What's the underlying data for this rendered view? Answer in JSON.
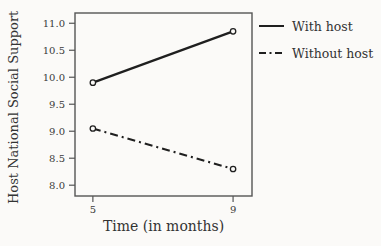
{
  "chart_data": {
    "type": "line",
    "title": "",
    "xlabel": "Time (in months)",
    "ylabel": "Host National Social Support",
    "x": [
      5,
      9
    ],
    "x_ticks": [
      5,
      9
    ],
    "x_tick_labels": [
      "5",
      "9"
    ],
    "y_ticks": [
      11.0,
      10.5,
      10.0,
      9.5,
      9.0,
      8.5,
      8.0
    ],
    "y_tick_labels": [
      "11.0",
      "10.5",
      "10.0",
      "9.5",
      "9.0",
      "8.5",
      "8.0"
    ],
    "xlim": [
      4.49,
      9.54
    ],
    "ylim": [
      7.8,
      11.19
    ],
    "grid": false,
    "marker": "open-circle",
    "legend_position": "right",
    "series": [
      {
        "id": "with-host",
        "name": "With host",
        "values": [
          9.9,
          10.85
        ],
        "line_style": "solid"
      },
      {
        "id": "without-host",
        "name": "Without host",
        "values": [
          9.05,
          8.3
        ],
        "line_style": "dash-dot"
      }
    ],
    "colors": {
      "line": "#1f1f1f",
      "frame": "#555555",
      "text": "#3a3a3a",
      "background": "#fbfaf8",
      "marker_fill": "#fbfaf8"
    }
  }
}
